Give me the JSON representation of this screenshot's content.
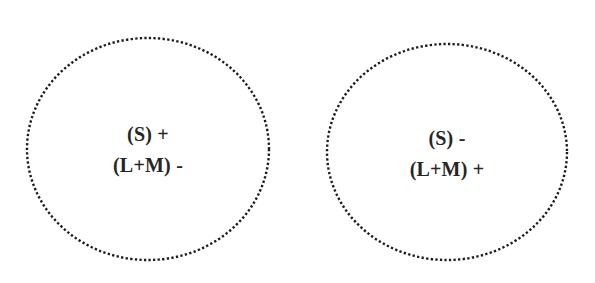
{
  "figure": {
    "background_color": "#ffffff",
    "ink_color": "#1c1c1c",
    "text_color": "#262626",
    "width": 595,
    "height": 283
  },
  "fields": [
    {
      "id": "s-on",
      "name": "S-ON / LM-OFF receptive field",
      "outline_style": "dotted",
      "outline_color": "#1c1c1c",
      "label_primary": "(S) +",
      "label_secondary": "(L+M) -",
      "cx": 123,
      "cy": 113,
      "rx": 121,
      "ry": 111
    },
    {
      "id": "s-off",
      "name": "S-OFF / LM-ON receptive field",
      "outline_style": "dotted",
      "outline_color": "#1c1c1c",
      "label_primary": "(S) -",
      "label_secondary": "(L+M) +",
      "cx": 122,
      "cy": 110,
      "rx": 120,
      "ry": 108
    }
  ]
}
